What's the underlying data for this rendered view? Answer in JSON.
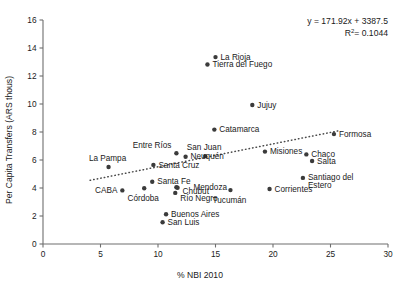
{
  "chart_data": {
    "type": "scatter",
    "title": "",
    "xlabel": "% NBI 2010",
    "ylabel": "Per Capita Transfers (ARS thous)",
    "xlim": [
      0,
      30
    ],
    "ylim": [
      0,
      16
    ],
    "xticks": [
      0,
      5,
      10,
      15,
      20,
      25,
      30
    ],
    "yticks": [
      0,
      2,
      4,
      6,
      8,
      10,
      12,
      14,
      16
    ],
    "grid": false,
    "legend": null,
    "annotations": {
      "equation": "y = 171.92x + 3387.5",
      "r_squared_prefix": "R",
      "r_squared_sup": "2",
      "r_squared_value": "= 0.1044"
    },
    "trendline": {
      "type": "dotted-linear",
      "x_start": 4.1,
      "y_start": 4.55,
      "x_end": 25.8,
      "y_end": 8.1,
      "slope_label": "171.92",
      "intercept_label": "3387.5"
    },
    "points": [
      {
        "name": "La Rioja",
        "x": 15.0,
        "y": 13.35,
        "label_dx": 5,
        "label_dy": 2.6,
        "anchor": "start"
      },
      {
        "name": "Tierra del Fuego",
        "x": 14.3,
        "y": 12.82,
        "label_dx": 5,
        "label_dy": 2.6,
        "anchor": "start"
      },
      {
        "name": "Jujuy",
        "x": 18.2,
        "y": 9.93,
        "label_dx": 5,
        "label_dy": 2.6,
        "anchor": "start"
      },
      {
        "name": "Catamarca",
        "x": 14.9,
        "y": 8.17,
        "label_dx": 5,
        "label_dy": 2.6,
        "anchor": "start"
      },
      {
        "name": "Formosa",
        "x": 25.3,
        "y": 7.85,
        "label_dx": 5,
        "label_dy": 2.6,
        "anchor": "start"
      },
      {
        "name": "Entre Ríos",
        "x": 11.6,
        "y": 6.48,
        "label_dx": -5,
        "label_dy": -5.2,
        "anchor": "end"
      },
      {
        "name": "San Juan",
        "x": 14.1,
        "y": 6.28,
        "label_dx": -1,
        "label_dy": -5.6,
        "anchor": "middle"
      },
      {
        "name": "Misiones",
        "x": 19.3,
        "y": 6.6,
        "label_dx": 5,
        "label_dy": 2.6,
        "anchor": "start"
      },
      {
        "name": "Chaco",
        "x": 22.9,
        "y": 6.4,
        "label_dx": 5,
        "label_dy": 2.6,
        "anchor": "start"
      },
      {
        "name": "Neuquén",
        "x": 12.4,
        "y": 6.23,
        "label_dx": 5,
        "label_dy": 2.6,
        "anchor": "start"
      },
      {
        "name": "Salta",
        "x": 23.4,
        "y": 5.93,
        "label_dx": 5,
        "label_dy": 2.6,
        "anchor": "start"
      },
      {
        "name": "La Pampa",
        "x": 5.7,
        "y": 5.5,
        "label_dx": -1,
        "label_dy": -6.2,
        "anchor": "middle"
      },
      {
        "name": "Santa Cruz",
        "x": 9.6,
        "y": 5.65,
        "label_dx": 5,
        "label_dy": 2.6,
        "anchor": "start"
      },
      {
        "name": "Santiago del",
        "x": 22.6,
        "y": 4.72,
        "label_dx": 5,
        "label_dy": 2.0,
        "anchor": "start"
      },
      {
        "name": "Estero",
        "x": 22.6,
        "y": 4.72,
        "label_dx": 5,
        "label_dy": 10.4,
        "anchor": "start",
        "continuation": true
      },
      {
        "name": "Santa Fe",
        "x": 9.5,
        "y": 4.45,
        "label_dx": 5,
        "label_dy": 2.6,
        "anchor": "start"
      },
      {
        "name": "Mendoza",
        "x": 11.6,
        "y": 4.05,
        "label_dx": 17,
        "label_dy": 2.6,
        "anchor": "start"
      },
      {
        "name": "Chubut",
        "x": 11.7,
        "y": 4.02,
        "label_dx": 5,
        "label_dy": 6.4,
        "anchor": "start"
      },
      {
        "name": "CABA",
        "x": 6.9,
        "y": 3.83,
        "label_dx": -5,
        "label_dy": 2.6,
        "anchor": "end"
      },
      {
        "name": "Córdoba",
        "x": 8.8,
        "y": 3.98,
        "label_dx": -1,
        "label_dy": 13.0,
        "anchor": "middle"
      },
      {
        "name": "Corrientes",
        "x": 19.7,
        "y": 3.93,
        "label_dx": 5,
        "label_dy": 2.6,
        "anchor": "start"
      },
      {
        "name": "Río Negro",
        "x": 11.5,
        "y": 3.65,
        "label_dx": 5,
        "label_dy": 8.2,
        "anchor": "start"
      },
      {
        "name": "Tucumán",
        "x": 16.3,
        "y": 3.85,
        "label_dx": -1,
        "label_dy": 12.6,
        "anchor": "middle"
      },
      {
        "name": "Buenos Aires",
        "x": 10.7,
        "y": 2.12,
        "label_dx": 5,
        "label_dy": 2.6,
        "anchor": "start"
      },
      {
        "name": "San Luis",
        "x": 10.4,
        "y": 1.55,
        "label_dx": 5,
        "label_dy": 2.6,
        "anchor": "start"
      }
    ]
  },
  "colors": {
    "point": "#3b3b3b",
    "axis": "#6e6e6e",
    "text": "#1a1a1a",
    "trend": "#4a4a4a",
    "background": "#ffffff"
  }
}
